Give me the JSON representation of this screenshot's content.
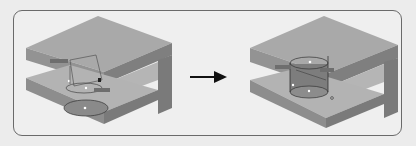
{
  "figure": {
    "arrow": "right-arrow",
    "left_panel": {
      "name": "before",
      "labels": [
        "dim-label-1",
        "dim-label-2"
      ]
    },
    "right_panel": {
      "name": "after",
      "labels": [
        "dim-label-1",
        "dim-label-2"
      ]
    },
    "colors": {
      "top_face": "#a9a9a9",
      "front_face": "#8f8f8f",
      "side_face": "#7c7c7c",
      "inner_face": "#b8b8b8",
      "frame_border": "#6a6a6a",
      "background": "#ececec"
    }
  }
}
